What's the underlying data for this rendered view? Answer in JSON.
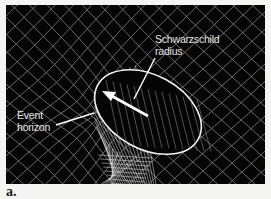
{
  "figure": {
    "labels": {
      "schwarzschild_line1": "Schwarzschild",
      "schwarzschild_line2": "radius",
      "event_line1": "Event",
      "event_line2": "horizon"
    },
    "subfigure_label": "a.",
    "colors": {
      "background": "#050505",
      "grid": "#cfcfcf",
      "annotation": "#ffffff",
      "page": "#f4f4f2"
    }
  }
}
